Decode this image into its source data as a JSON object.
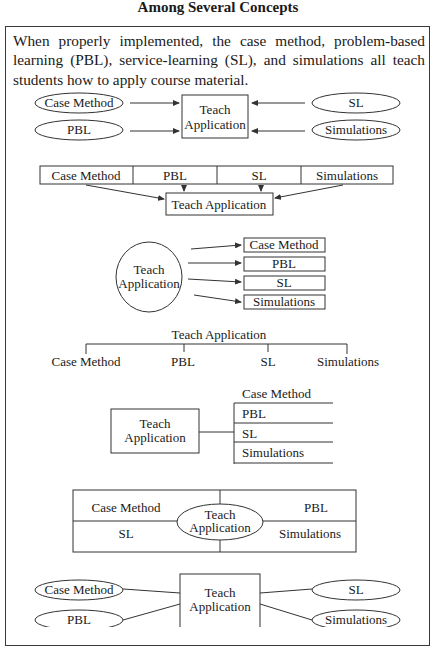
{
  "title": "Among Several Concepts",
  "paragraph": "When properly implemented, the case method, problem-based learning (PBL), service-learning (SL), and simulations all teach students how to apply course material.",
  "center_concept": {
    "line1": "Teach",
    "line2": "Application",
    "full": "Teach Application"
  },
  "concepts": [
    "Case Method",
    "PBL",
    "SL",
    "Simulations"
  ],
  "diagrams": [
    {
      "id": "ovals-arrows-to-box",
      "description": "Four ovals with arrows pointing into a central box"
    },
    {
      "id": "row-arrows-to-box",
      "description": "Horizontal row of four cells with arrows to box below"
    },
    {
      "id": "circle-arrows-to-boxes",
      "description": "Circle with arrows pointing to four stacked boxes"
    },
    {
      "id": "hierarchy-bracket",
      "description": "Title above a bracket connecting four labels"
    },
    {
      "id": "box-to-list",
      "description": "Box linked to a ruled list of four items"
    },
    {
      "id": "quadrants-with-center-ellipse",
      "description": "Four quadrants with center ellipse"
    },
    {
      "id": "ovals-lines-to-box",
      "description": "Four ovals connected by lines to a central box"
    }
  ],
  "colors": {
    "stroke": "#333333",
    "text": "#1a1a1a",
    "background": "#ffffff"
  }
}
